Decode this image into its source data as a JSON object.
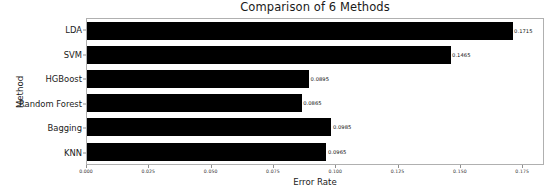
{
  "chart_data": {
    "type": "bar",
    "orientation": "horizontal",
    "title": "Comparison of 6 Methods",
    "xlabel": "Error Rate",
    "ylabel": "Method",
    "categories": [
      "LDA",
      "SVM",
      "HGBoost",
      "Random Forest",
      "Bagging",
      "KNN"
    ],
    "values": [
      0.1715,
      0.1465,
      0.0895,
      0.0865,
      0.0985,
      0.0965
    ],
    "data_labels": [
      "0.1715",
      "0.1465",
      "0.0895",
      "0.0865",
      "0.0985",
      "0.0965"
    ],
    "xlim": [
      0.0,
      0.18375
    ],
    "xticks": [
      0.0,
      0.025,
      0.05,
      0.075,
      0.1,
      0.125,
      0.15,
      0.175
    ],
    "xtick_labels": [
      "0.000",
      "0.025",
      "0.050",
      "0.075",
      "0.100",
      "0.125",
      "0.150",
      "0.175"
    ],
    "grid": false,
    "legend": null,
    "bar_color": "#000000",
    "background_color": "#ffffff",
    "axis_color": "#b0b0b0"
  }
}
